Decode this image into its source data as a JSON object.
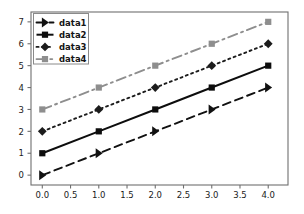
{
  "chart_data": {
    "type": "line",
    "title": "",
    "xlabel": "",
    "ylabel": "",
    "x": [
      0,
      1,
      2,
      3,
      4
    ],
    "xlim": [
      -0.2,
      4.35
    ],
    "ylim": [
      -0.45,
      7.45
    ],
    "grid": false,
    "legend_position": "upper left",
    "xticks": [
      0,
      0.5,
      1,
      1.5,
      2,
      2.5,
      3,
      3.5,
      4
    ],
    "xtick_labels": [
      "0.0",
      "0.5",
      "1.0",
      "1.5",
      "2.0",
      "2.5",
      "3.0",
      "3.5",
      "4.0"
    ],
    "yticks": [
      0,
      1,
      2,
      3,
      4,
      5,
      6,
      7
    ],
    "ytick_labels": [
      "0",
      "1",
      "2",
      "3",
      "4",
      "5",
      "6",
      "7"
    ],
    "series": [
      {
        "name": "data1",
        "values": [
          0,
          1,
          2,
          3,
          4
        ],
        "color": "#111111",
        "linestyle": "dashed",
        "marker": "triangle-right"
      },
      {
        "name": "data2",
        "values": [
          1,
          2,
          3,
          4,
          5
        ],
        "color": "#0d0d0d",
        "linestyle": "solid",
        "marker": "square"
      },
      {
        "name": "data3",
        "values": [
          2,
          3,
          4,
          5,
          6
        ],
        "color": "#1c1c1c",
        "linestyle": "dotted",
        "marker": "diamond"
      },
      {
        "name": "data4",
        "values": [
          3,
          4,
          5,
          6,
          7
        ],
        "color": "#8e8e8e",
        "linestyle": "dashdot",
        "marker": "square"
      }
    ]
  },
  "legend": {
    "entries": [
      "data1",
      "data2",
      "data3",
      "data4"
    ]
  },
  "colors": {
    "background": "#ffffff",
    "spine": "#6f6f6f",
    "tick_text": "#1a1a1a"
  }
}
